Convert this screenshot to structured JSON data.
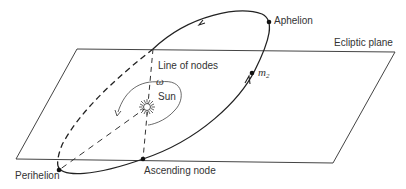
{
  "diagram": {
    "type": "orbital-elements",
    "colors": {
      "ink": "#222222",
      "text": "#333333",
      "background": "#ffffff"
    },
    "labels": {
      "aphelion": "Aphelion",
      "ecliptic_plane": "Ecliptic plane",
      "line_of_nodes": "Line of nodes",
      "omega": "ω",
      "sun": "Sun",
      "m2_base": "m",
      "m2_sub": "2",
      "perihelion": "Perihelion",
      "ascending_node": "Ascending node"
    },
    "nodes": [
      {
        "id": "aphelion",
        "label": "Aphelion"
      },
      {
        "id": "perihelion",
        "label": "Perihelion"
      },
      {
        "id": "ascending-node",
        "label": "Ascending node"
      },
      {
        "id": "m2",
        "label": "m2"
      },
      {
        "id": "sun",
        "label": "Sun"
      }
    ],
    "edges": [
      {
        "from": "ascending-node",
        "to": "sun",
        "label": "Line of nodes",
        "style": "dashed"
      },
      {
        "from": "sun",
        "to": "perihelion",
        "style": "dashed"
      },
      {
        "from": "perihelion",
        "to": "aphelion",
        "label": "orbit",
        "style": "solid-above / dashed-below plane"
      }
    ]
  }
}
